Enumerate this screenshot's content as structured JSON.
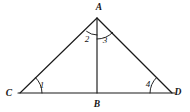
{
  "figure": {
    "background_color": "#ffffff",
    "stroke_color": "#1a1a1a",
    "vertices": [
      {
        "id": "A",
        "label": "A",
        "x": 97,
        "y": 18,
        "label_x": 99,
        "label_y": 10
      },
      {
        "id": "C",
        "label": "C",
        "x": 20,
        "y": 93,
        "label_x": 9,
        "label_y": 96
      },
      {
        "id": "D",
        "label": "D",
        "x": 172,
        "y": 93,
        "label_x": 178,
        "label_y": 95
      },
      {
        "id": "B",
        "label": "B",
        "x": 97,
        "y": 93,
        "label_x": 97,
        "label_y": 107
      }
    ],
    "segments": [
      {
        "id": "CD",
        "name": "baseline-cd",
        "x1": 18,
        "y1": 93,
        "x2": 175,
        "y2": 93
      },
      {
        "id": "CA",
        "name": "side-ca",
        "x1": 20,
        "y1": 93,
        "x2": 97,
        "y2": 18
      },
      {
        "id": "AD",
        "name": "side-ad",
        "x1": 97,
        "y1": 18,
        "x2": 172,
        "y2": 93
      },
      {
        "id": "AB",
        "name": "altitude-ab",
        "x1": 97,
        "y1": 18,
        "x2": 97,
        "y2": 93
      }
    ],
    "angles": [
      {
        "id": "1",
        "label": "1",
        "at": "C",
        "label_x": 42,
        "label_y": 88,
        "arc": "M 42 93 A 22 22 0 0 0 35.5 77.6"
      },
      {
        "id": "2",
        "label": "2",
        "at": "A",
        "label_x": 87,
        "label_y": 42,
        "arc": "M 86.6 31.4 A 17 17 0 0 0 97 35"
      },
      {
        "id": "3",
        "label": "3",
        "at": "A",
        "label_x": 105,
        "label_y": 43,
        "arc": "M 97 39 A 22 22 0 0 0 112.6 32.5"
      },
      {
        "id": "4",
        "label": "4",
        "at": "D",
        "label_x": 148,
        "label_y": 87,
        "arc": "M 150 93 A 22 22 0 0 1 156.5 77.6"
      }
    ]
  }
}
